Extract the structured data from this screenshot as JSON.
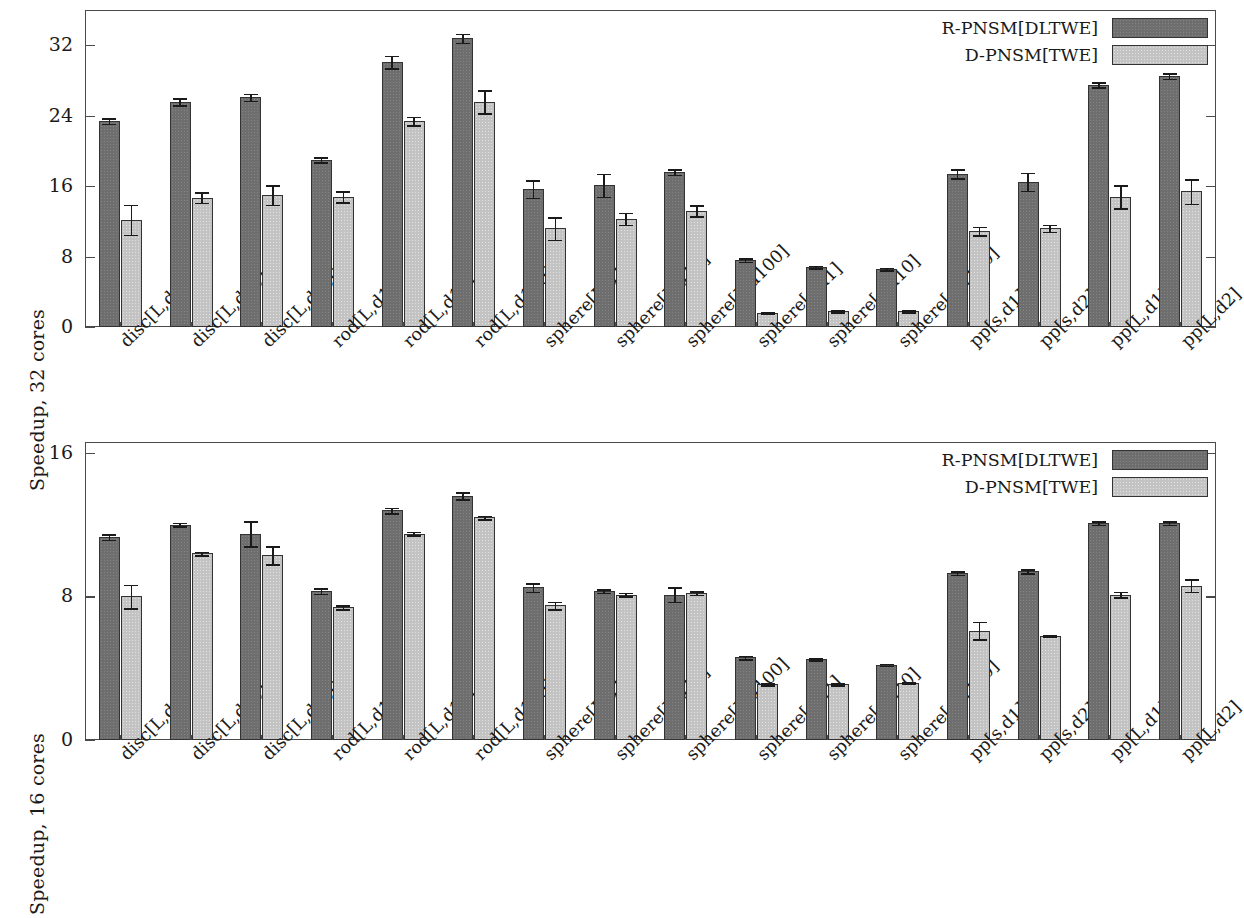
{
  "colors": {
    "series_dark": "#6e6e6e",
    "series_light": "#c3c3c3",
    "axis": "#4a4a4a",
    "text": "#1a1a1a",
    "background": "#ffffff"
  },
  "legend": {
    "series_1_label": "R-PNSM[DLTWE]",
    "series_2_label": "D-PNSM[TWE]"
  },
  "chart_data": [
    {
      "type": "bar",
      "panel": "top",
      "title": "",
      "xlabel": "",
      "ylabel": "Speedup, 32 cores",
      "ylim": [
        0,
        36
      ],
      "yticks": [
        0,
        8,
        16,
        24,
        32
      ],
      "ytick_labels": [
        "0",
        "8",
        "16",
        "24",
        "32"
      ],
      "grid": false,
      "legend_position": "top-right",
      "categories": [
        "disc[L,d1]",
        "disc[L,d10]",
        "disc[L,d100]",
        "rod[L,d1]",
        "rod[L,d10]",
        "rod[L,d100]",
        "sphere[L,d1]",
        "sphere[L,d10]",
        "sphere[L,d100]",
        "sphere[s,d1]",
        "sphere[s,d10]",
        "sphere[s,d100]",
        "pp[s,d1]",
        "pp[s,d2]",
        "pp[L,d1]",
        "pp[L,d2]"
      ],
      "series": [
        {
          "name": "R-PNSM[DLTWE]",
          "color": "#6e6e6e",
          "values": [
            23.4,
            25.6,
            26.1,
            19.0,
            30.1,
            32.8,
            15.7,
            16.1,
            17.6,
            7.6,
            6.8,
            6.6,
            17.4,
            16.5,
            27.5,
            28.5
          ],
          "errors": [
            0.3,
            0.4,
            0.4,
            0.3,
            0.7,
            0.5,
            1.0,
            1.3,
            0.3,
            0.2,
            0.15,
            0.15,
            0.5,
            1.0,
            0.3,
            0.3
          ]
        },
        {
          "name": "D-PNSM[TWE]",
          "color": "#c3c3c3",
          "values": [
            12.2,
            14.7,
            15.0,
            14.8,
            23.4,
            25.6,
            11.2,
            12.3,
            13.2,
            1.6,
            1.8,
            1.8,
            10.9,
            11.2,
            14.8,
            15.4
          ],
          "errors": [
            1.7,
            0.6,
            1.1,
            0.6,
            0.5,
            1.3,
            1.3,
            0.7,
            0.6,
            0.1,
            0.1,
            0.1,
            0.5,
            0.4,
            1.3,
            1.4
          ]
        }
      ]
    },
    {
      "type": "bar",
      "panel": "bottom",
      "title": "",
      "xlabel": "",
      "ylabel": "Speedup, 16 cores",
      "ylim": [
        0,
        16.6
      ],
      "yticks": [
        0,
        8,
        16
      ],
      "ytick_labels": [
        "0",
        "8",
        "16"
      ],
      "grid": false,
      "legend_position": "top-right",
      "categories": [
        "disc[L,d1]",
        "disc[L,d10]",
        "disc[L,d100]",
        "rod[L,d1]",
        "rod[L,d10]",
        "rod[L,d100]",
        "sphere[L,d1]",
        "sphere[L,d10]",
        "sphere[L,d100]",
        "sphere[s,d1]",
        "sphere[s,d10]",
        "sphere[s,d100]",
        "pp[s,d1]",
        "pp[s,d2]",
        "pp[L,d1]",
        "pp[L,d2]"
      ],
      "series": [
        {
          "name": "R-PNSM[DLTWE]",
          "color": "#6e6e6e",
          "values": [
            11.3,
            12.0,
            11.5,
            8.3,
            12.8,
            13.6,
            8.5,
            8.3,
            8.1,
            4.6,
            4.5,
            4.2,
            9.3,
            9.4,
            12.1,
            12.1
          ],
          "errors": [
            0.15,
            0.1,
            0.7,
            0.15,
            0.15,
            0.2,
            0.25,
            0.1,
            0.4,
            0.1,
            0.05,
            0.05,
            0.1,
            0.1,
            0.1,
            0.1
          ]
        },
        {
          "name": "D-PNSM[TWE]",
          "color": "#c3c3c3",
          "values": [
            8.0,
            10.4,
            10.3,
            7.4,
            11.5,
            12.4,
            7.5,
            8.1,
            8.2,
            3.1,
            3.1,
            3.2,
            6.1,
            5.8,
            8.1,
            8.6
          ],
          "errors": [
            0.65,
            0.1,
            0.5,
            0.1,
            0.1,
            0.1,
            0.2,
            0.1,
            0.1,
            0.05,
            0.05,
            0.05,
            0.5,
            0.05,
            0.15,
            0.35
          ]
        }
      ]
    }
  ]
}
